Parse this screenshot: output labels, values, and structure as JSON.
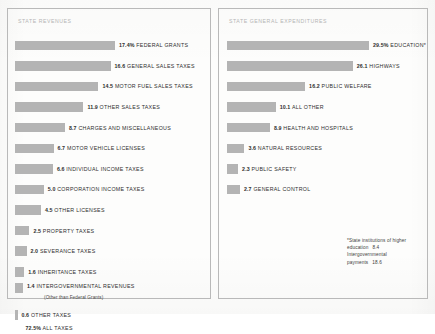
{
  "chart_data": [
    {
      "type": "bar",
      "title": "STATE REVENUES",
      "orientation": "horizontal",
      "xlabel": "",
      "ylabel": "",
      "units": "percent of total",
      "grid": false,
      "legend": "none",
      "xlim": [
        0,
        17.4
      ],
      "categories": [
        "FEDERAL GRANTS",
        "GENERAL SALES TAXES",
        "MOTOR FUEL SALES TAXES",
        "OTHER SALES TAXES",
        "CHARGES AND MISCELLANEOUS",
        "MOTOR VEHICLE LICENSES",
        "INDIVIDUAL INCOME TAXES",
        "CORPORATION INCOME TAXES",
        "OTHER LICENSES",
        "PROPERTY TAXES",
        "SEVERANCE TAXES",
        "INHERITANCE TAXES",
        "INTERGOVERNMENTAL REVENUES",
        "OTHER TAXES",
        "ALL TAXES"
      ],
      "values": [
        17.4,
        16.6,
        14.5,
        11.9,
        8.7,
        6.7,
        6.6,
        5.0,
        4.5,
        2.5,
        2.0,
        1.6,
        1.4,
        0.6,
        72.5
      ],
      "value_labels": [
        "17.4%",
        "16.6",
        "14.5",
        "11.9",
        "8.7",
        "6.7",
        "6.6",
        "5.0",
        "4.5",
        "2.5",
        "2.0",
        "1.6",
        "1.4",
        "0.6",
        "72.5%"
      ],
      "annotations": [
        "(Other than Federal Grants)"
      ]
    },
    {
      "type": "bar",
      "title": "STATE GENERAL EXPENDITURES",
      "orientation": "horizontal",
      "xlabel": "",
      "ylabel": "",
      "units": "percent of total",
      "grid": false,
      "legend": "none",
      "xlim": [
        0,
        29.5
      ],
      "categories": [
        "EDUCATION*",
        "HIGHWAYS",
        "PUBLIC WELFARE",
        "ALL OTHER",
        "HEALTH AND HOSPITALS",
        "NATURAL RESOURCES",
        "PUBLIC SAFETY",
        "GENERAL CONTROL"
      ],
      "values": [
        29.5,
        26.1,
        16.2,
        10.1,
        8.9,
        3.6,
        2.3,
        2.7
      ],
      "value_labels": [
        "29.5%",
        "26.1",
        "16.2",
        "10.1",
        "8.9",
        "3.6",
        "2.3",
        "2.7"
      ],
      "annotations": [
        "*State institutions of higher",
        "education   8.4",
        "Intergovernmental",
        "payments   18.6"
      ]
    }
  ],
  "revenues": {
    "title": "STATE REVENUES",
    "rows": [
      {
        "value": "17.4%",
        "name": "FEDERAL GRANTS"
      },
      {
        "value": "16.6",
        "name": "GENERAL SALES TAXES"
      },
      {
        "value": "14.5",
        "name": "MOTOR FUEL SALES TAXES"
      },
      {
        "value": "11.9",
        "name": "OTHER SALES TAXES"
      },
      {
        "value": "8.7",
        "name": "CHARGES AND MISCELLANEOUS"
      },
      {
        "value": "6.7",
        "name": "MOTOR VEHICLE LICENSES"
      },
      {
        "value": "6.6",
        "name": "INDIVIDUAL INCOME TAXES"
      },
      {
        "value": "5.0",
        "name": "CORPORATION INCOME TAXES"
      },
      {
        "value": "4.5",
        "name": "OTHER LICENSES"
      },
      {
        "value": "2.5",
        "name": "PROPERTY TAXES"
      },
      {
        "value": "2.0",
        "name": "SEVERANCE TAXES"
      },
      {
        "value": "1.6",
        "name": "INHERITANCE TAXES"
      },
      {
        "value": "1.4",
        "name": "INTERGOVERNMENTAL REVENUES",
        "sub": "(Other than Federal Grants)"
      },
      {
        "value": "0.6",
        "name": "OTHER TAXES"
      },
      {
        "value": "72.5%",
        "name": "ALL TAXES"
      }
    ]
  },
  "expenditures": {
    "title": "STATE GENERAL EXPENDITURES",
    "rows": [
      {
        "value": "29.5%",
        "name": "EDUCATION*"
      },
      {
        "value": "26.1",
        "name": "HIGHWAYS"
      },
      {
        "value": "16.2",
        "name": "PUBLIC WELFARE"
      },
      {
        "value": "10.1",
        "name": "ALL OTHER"
      },
      {
        "value": "8.9",
        "name": "HEALTH AND HOSPITALS"
      },
      {
        "value": "3.6",
        "name": "NATURAL RESOURCES"
      },
      {
        "value": "2.3",
        "name": "PUBLIC SAFETY"
      },
      {
        "value": "2.7",
        "name": "GENERAL CONTROL"
      }
    ],
    "footnote": {
      "line1": "*State institutions of higher",
      "line2": "education",
      "line2_value": "8.4",
      "line3": "Intergovernmental",
      "line4": "payments",
      "line4_value": "18.6"
    }
  },
  "style": {
    "bar_color": "#b4b4b4",
    "border_color": "#b9b9b9",
    "title_color": "#b5b5b5",
    "text_color": "#2e2e2e",
    "page_background": "#fdfdfc"
  }
}
